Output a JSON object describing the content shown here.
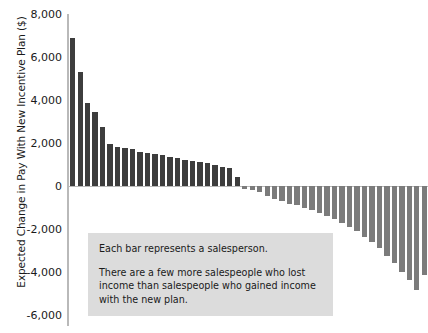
{
  "chart_data": {
    "type": "bar",
    "title": "",
    "subtitle": "",
    "xlabel": "",
    "ylabel": "Expected Change in Pay With New Incentive Plan ($)",
    "ylim": [
      -6000,
      8000
    ],
    "ytick_labels": [
      "8,000",
      "6,000",
      "4,000",
      "2,000",
      "0",
      "-2,000",
      "-4,000",
      "-6,000"
    ],
    "ytick_values": [
      8000,
      6000,
      4000,
      2000,
      0,
      -2000,
      -4000,
      -6000
    ],
    "xtick_labels": [],
    "grid": false,
    "legend_position": "none",
    "series": [
      {
        "name": "Expected change in pay per salesperson",
        "categories": [
          "s1",
          "s2",
          "s3",
          "s4",
          "s5",
          "s6",
          "s7",
          "s8",
          "s9",
          "s10",
          "s11",
          "s12",
          "s13",
          "s14",
          "s15",
          "s16",
          "s17",
          "s18",
          "s19",
          "s20",
          "s21",
          "s22",
          "s23",
          "s24",
          "s25",
          "s26",
          "s27",
          "s28",
          "s29",
          "s30",
          "s31",
          "s32",
          "s33",
          "s34",
          "s35",
          "s36",
          "s37",
          "s38",
          "s39",
          "s40",
          "s41",
          "s42",
          "s43",
          "s44",
          "s45",
          "s46",
          "s47",
          "s48"
        ],
        "values": [
          6900,
          5300,
          3850,
          3450,
          2750,
          1950,
          1800,
          1750,
          1700,
          1600,
          1550,
          1500,
          1420,
          1350,
          1280,
          1200,
          1150,
          1100,
          1050,
          980,
          900,
          820,
          400,
          -120,
          -180,
          -300,
          -450,
          -600,
          -700,
          -820,
          -900,
          -1000,
          -1100,
          -1250,
          -1400,
          -1550,
          -1700,
          -1900,
          -2100,
          -2350,
          -2600,
          -2900,
          -3250,
          -3600,
          -4000,
          -4350,
          -4850,
          -4150
        ],
        "positive_color": "#3d3d3d",
        "negative_color": "#7b7b7b",
        "positive_count": 23,
        "negative_count": 25
      }
    ],
    "annotations": [
      {
        "name": "explanation-box",
        "line_1": "Each bar represents a salesperson.",
        "line_2": "There are a few more salespeople who lost income than salespeople who gained income with the new plan.",
        "background_color": "#dcdcdc"
      }
    ]
  },
  "axis": {
    "line_color": "#b9b9b9"
  }
}
